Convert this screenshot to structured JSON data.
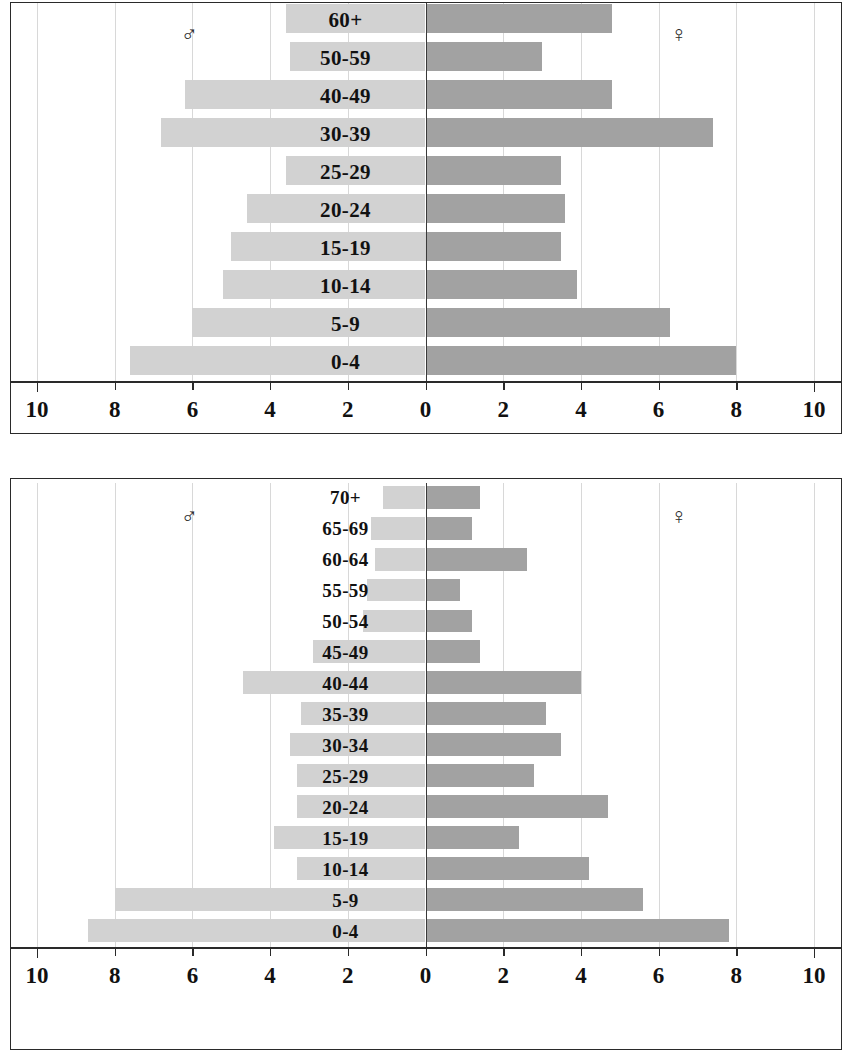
{
  "chart_data": [
    {
      "type": "bar",
      "subtype": "population-pyramid",
      "title": "",
      "xlabel": "",
      "ylabel": "",
      "xlim": [
        -10,
        10
      ],
      "axis_ticks": [
        "10",
        "8",
        "6",
        "4",
        "2",
        "0",
        "2",
        "4",
        "6",
        "8",
        "10"
      ],
      "axis_tick_values": [
        -10,
        -8,
        -6,
        -4,
        -2,
        0,
        2,
        4,
        6,
        8,
        10
      ],
      "grid": true,
      "grid_interval": 2,
      "legend": {
        "male_symbol": "♂",
        "female_symbol": "♀",
        "male_position": "left",
        "female_position": "right"
      },
      "colors": {
        "male": "#d2d2d2",
        "female": "#a2a2a2",
        "axis": "#2a2a2a",
        "grid": "#d8d8d8"
      },
      "categories": [
        "60+",
        "50-59",
        "40-49",
        "30-39",
        "25-29",
        "20-24",
        "15-19",
        "10-14",
        "5-9",
        "0-4"
      ],
      "series": [
        {
          "name": "Male",
          "side": "left",
          "values": [
            3.6,
            3.5,
            6.2,
            6.8,
            3.6,
            4.6,
            5.0,
            5.2,
            6.0,
            7.6
          ]
        },
        {
          "name": "Female",
          "side": "right",
          "values": [
            4.8,
            3.0,
            4.8,
            7.4,
            3.5,
            3.6,
            3.5,
            3.9,
            6.3,
            8.0
          ]
        }
      ]
    },
    {
      "type": "bar",
      "subtype": "population-pyramid",
      "title": "",
      "xlabel": "",
      "ylabel": "",
      "xlim": [
        -10,
        10
      ],
      "axis_ticks": [
        "10",
        "8",
        "6",
        "4",
        "2",
        "0",
        "2",
        "4",
        "6",
        "8",
        "10"
      ],
      "axis_tick_values": [
        -10,
        -8,
        -6,
        -4,
        -2,
        0,
        2,
        4,
        6,
        8,
        10
      ],
      "grid": true,
      "grid_interval": 2,
      "legend": {
        "male_symbol": "♂",
        "female_symbol": "♀",
        "male_position": "left",
        "female_position": "right"
      },
      "colors": {
        "male": "#d2d2d2",
        "female": "#a2a2a2",
        "axis": "#2a2a2a",
        "grid": "#d8d8d8"
      },
      "categories": [
        "70+",
        "65-69",
        "60-64",
        "55-59",
        "50-54",
        "45-49",
        "40-44",
        "35-39",
        "30-34",
        "25-29",
        "20-24",
        "15-19",
        "10-14",
        "5-9",
        "0-4"
      ],
      "series": [
        {
          "name": "Male",
          "side": "left",
          "values": [
            1.1,
            1.4,
            1.3,
            1.5,
            1.6,
            2.9,
            4.7,
            3.2,
            3.5,
            3.3,
            3.3,
            3.9,
            3.3,
            8.0,
            8.7
          ]
        },
        {
          "name": "Female",
          "side": "right",
          "values": [
            1.4,
            1.2,
            2.6,
            0.9,
            1.2,
            1.4,
            4.0,
            3.1,
            3.5,
            2.8,
            4.7,
            2.4,
            4.2,
            5.6,
            7.8
          ]
        }
      ]
    }
  ]
}
